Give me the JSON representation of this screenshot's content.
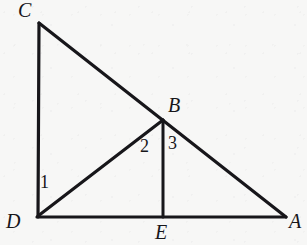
{
  "figure": {
    "kind": "geometry-diagram",
    "background_color": "#f7f7f6",
    "stroke_color": "#17161a",
    "canvas": {
      "width": 307,
      "height": 245
    }
  },
  "points": {
    "C": {
      "label": "C",
      "x": 39,
      "y": 23,
      "label_x": 18,
      "label_y": 0
    },
    "D": {
      "label": "D",
      "x": 38,
      "y": 217,
      "label_x": 6,
      "label_y": 211
    },
    "A": {
      "label": "A",
      "x": 285,
      "y": 217,
      "label_x": 289,
      "label_y": 211
    },
    "B": {
      "label": "B",
      "x": 162,
      "y": 120,
      "label_x": 168,
      "label_y": 95
    },
    "E": {
      "label": "E",
      "x": 163,
      "y": 217,
      "label_x": 155,
      "label_y": 222
    }
  },
  "segments": [
    {
      "name": "CD",
      "from": "C",
      "to": "D",
      "x1": 39,
      "y1": 23,
      "x2": 38,
      "y2": 217,
      "width": 3.2
    },
    {
      "name": "DA",
      "from": "D",
      "to": "A",
      "x1": 37,
      "y1": 217,
      "x2": 286,
      "y2": 217,
      "width": 3.2
    },
    {
      "name": "CA",
      "from": "C",
      "to": "A",
      "x1": 39,
      "y1": 23,
      "x2": 286,
      "y2": 217,
      "width": 3.2
    },
    {
      "name": "DB",
      "from": "D",
      "to": "B",
      "x1": 38,
      "y1": 216,
      "x2": 163,
      "y2": 120,
      "width": 3.2
    },
    {
      "name": "BE",
      "from": "B",
      "to": "E",
      "x1": 163,
      "y1": 120,
      "x2": 163,
      "y2": 217,
      "width": 3.0
    }
  ],
  "angle_marks": [
    {
      "name": "angle-1",
      "label": "1",
      "at_vertex": "D",
      "x": 40,
      "y": 173
    },
    {
      "name": "angle-2",
      "label": "2",
      "at_vertex": "B",
      "x": 140,
      "y": 137
    },
    {
      "name": "angle-3",
      "label": "3",
      "at_vertex": "B",
      "x": 168,
      "y": 134
    }
  ]
}
